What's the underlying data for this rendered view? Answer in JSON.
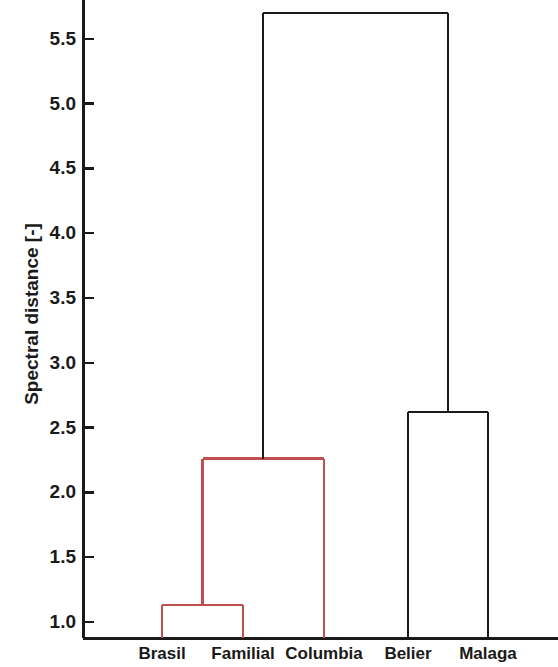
{
  "chart_data": {
    "type": "dendrogram",
    "title": "",
    "xlabel": "",
    "ylabel": "Spectral distance [-]",
    "ylim": [
      0.876,
      5.82
    ],
    "ytick_labels": [
      "5.5",
      "5.0",
      "4.5",
      "4.0",
      "3.5",
      "3.0",
      "2.5",
      "2.0",
      "1.5",
      "1.0"
    ],
    "ytick_values": [
      5.5,
      5.0,
      4.5,
      4.0,
      3.5,
      3.0,
      2.5,
      2.0,
      1.5,
      1.0
    ],
    "grid": false,
    "legend": "none",
    "leaves": [
      {
        "label": "Brasil",
        "x": 162
      },
      {
        "label": "Familial",
        "x": 243
      },
      {
        "label": "Columbia",
        "x": 324
      },
      {
        "label": "Belier",
        "x": 408
      },
      {
        "label": "Malaga",
        "x": 488
      }
    ],
    "merges": [
      {
        "id": "m1",
        "members": [
          "Brasil",
          "Familial"
        ],
        "height": 1.13,
        "color": "#c0504d",
        "left_x": 162,
        "right_x": 243,
        "left_base": 0.876,
        "right_base": 0.876
      },
      {
        "id": "m2",
        "members": [
          "Brasil",
          "Familial",
          "Columbia"
        ],
        "height": 2.26,
        "color": "#c0504d",
        "left_x": 202.5,
        "right_x": 324,
        "left_base": 1.13,
        "right_base": 0.876
      },
      {
        "id": "m3",
        "members": [
          "Belier",
          "Malaga"
        ],
        "height": 2.62,
        "color": "#1a1a1a",
        "left_x": 408,
        "right_x": 488,
        "left_base": 0.876,
        "right_base": 0.876
      },
      {
        "id": "m4",
        "members": [
          "Brasil",
          "Familial",
          "Columbia",
          "Belier",
          "Malaga"
        ],
        "height": 5.7,
        "color": "#1a1a1a",
        "left_x": 263,
        "right_x": 448,
        "left_base": 2.26,
        "right_base": 2.62
      }
    ],
    "colors": {
      "cluster_red": "#c0504d",
      "cluster_black": "#1a1a1a",
      "axis": "#1a1a1a",
      "background": "#ffffff"
    }
  },
  "axes": {
    "y_axis_x": 83,
    "baseline_y": 638,
    "tick_length": 11,
    "px_per_unit": 129.6,
    "y_at_1": 622
  }
}
